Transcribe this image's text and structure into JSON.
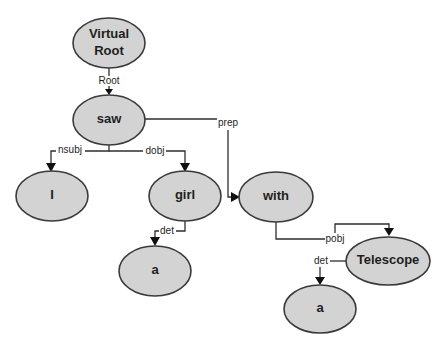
{
  "diagram": {
    "type": "dependency-parse-tree",
    "colors": {
      "node_fill": "#d3d3d3",
      "node_stroke": "#3a3a3a",
      "edge": "#2e2e2e",
      "background": "#ffffff"
    },
    "nodes": {
      "virtual_root": {
        "line1": "Virtual",
        "line2": "Root"
      },
      "saw": {
        "label": "saw"
      },
      "i": {
        "label": "I"
      },
      "girl": {
        "label": "girl"
      },
      "a_girl": {
        "label": "a"
      },
      "with": {
        "label": "with"
      },
      "telescope": {
        "label": "Telescope"
      },
      "a_telescope": {
        "label": "a"
      }
    },
    "edges": {
      "root": {
        "label": "Root",
        "from": "Virtual Root",
        "to": "saw"
      },
      "nsubj": {
        "label": "nsubj",
        "from": "saw",
        "to": "I"
      },
      "dobj": {
        "label": "dobj",
        "from": "saw",
        "to": "girl"
      },
      "prep": {
        "label": "prep",
        "from": "saw",
        "to": "with"
      },
      "det_girl": {
        "label": "det",
        "from": "girl",
        "to": "a"
      },
      "pobj": {
        "label": "pobj",
        "from": "with",
        "to": "Telescope"
      },
      "det_telescope": {
        "label": "det",
        "from": "Telescope",
        "to": "a"
      }
    }
  }
}
